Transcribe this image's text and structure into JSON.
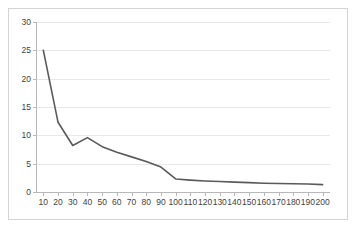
{
  "chart_data": {
    "type": "line",
    "title": "",
    "subtitle": "",
    "xlabel": "",
    "ylabel": "",
    "categories": [
      10,
      20,
      30,
      40,
      50,
      60,
      70,
      80,
      90,
      100,
      110,
      120,
      130,
      140,
      150,
      160,
      170,
      180,
      190,
      200
    ],
    "x_tick_labels": [
      "10",
      "20",
      "30",
      "40",
      "50",
      "60",
      "70",
      "80",
      "90",
      "100",
      "110",
      "120",
      "130",
      "140",
      "150",
      "160",
      "170",
      "180",
      "190",
      "200"
    ],
    "values": [
      25.0,
      12.3,
      8.2,
      9.6,
      8.0,
      7.0,
      6.2,
      5.4,
      4.4,
      2.3,
      2.1,
      1.95,
      1.85,
      1.75,
      1.65,
      1.55,
      1.5,
      1.45,
      1.4,
      1.3
    ],
    "series": [
      {
        "name": "series-1",
        "color": "#5a5a5a",
        "values": [
          25.0,
          12.3,
          8.2,
          9.6,
          8.0,
          7.0,
          6.2,
          5.4,
          4.4,
          2.3,
          2.1,
          1.95,
          1.85,
          1.75,
          1.65,
          1.55,
          1.5,
          1.45,
          1.4,
          1.3
        ]
      }
    ],
    "ylim": [
      0,
      30
    ],
    "y_ticks": [
      0,
      5,
      10,
      15,
      20,
      25,
      30
    ],
    "y_tick_labels": [
      "0",
      "5",
      "10",
      "15",
      "20",
      "25",
      "30"
    ],
    "grid": {
      "horizontal": true,
      "vertical": false,
      "color": "#e8e8e8"
    },
    "legend": {
      "visible": false,
      "position": "none",
      "entries": []
    },
    "axis_color": "#b8b8b8",
    "plot_background": "#ffffff",
    "frame_border_color": "#d4d4d4",
    "annotations": []
  }
}
